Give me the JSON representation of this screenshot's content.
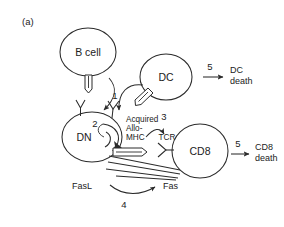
{
  "figure": {
    "panel_label": "(a)",
    "background_color": "#ffffff",
    "stroke_color": "#2b2b2b"
  },
  "cells": {
    "b_cell": {
      "label": "B cell",
      "cx": 88,
      "cy": 52,
      "rx": 28,
      "ry": 24
    },
    "dc": {
      "label": "DC",
      "cx": 166,
      "cy": 77,
      "rx": 26,
      "ry": 23
    },
    "dn": {
      "label": "DN",
      "cx": 92,
      "cy": 137,
      "rx": 30,
      "ry": 25
    },
    "cd8": {
      "label": "CD8",
      "cx": 200,
      "cy": 151,
      "rx": 28,
      "ry": 27
    }
  },
  "steps": {
    "one": "1",
    "two": "2",
    "three": "3",
    "four": "4",
    "five_dc": "5",
    "five_cd8": "5"
  },
  "molecules": {
    "acquired": "Acquired",
    "allo": "Allo-",
    "mhc": "MHC",
    "tcr": "TCR",
    "fasl": "FasL",
    "fas": "Fas"
  },
  "outcomes": {
    "dc_death_line1": "DC",
    "dc_death_line2": "death",
    "cd8_death_line1": "CD8",
    "cd8_death_line2": "death"
  },
  "icons": {
    "b_cell_mhc": "mhc-molecule-icon",
    "dc_mhc": "mhc-molecule-icon",
    "dn_acquired_mhc": "acquired-mhc-icon",
    "dn_tcr": "tcr-receptor-icon",
    "cd8_tcr": "tcr-receptor-icon",
    "trogocytosis_arrow_b": "transfer-arrow-icon",
    "trogocytosis_arrow_dc": "transfer-arrow-icon",
    "internalization_arrow": "curved-recycle-arrow-icon",
    "engagement_arrow": "engagement-arrow-icon",
    "fas_arrow": "fas-killing-arrow-icon",
    "dc_death_arrow": "straight-arrow-icon",
    "cd8_death_arrow": "straight-arrow-icon"
  }
}
